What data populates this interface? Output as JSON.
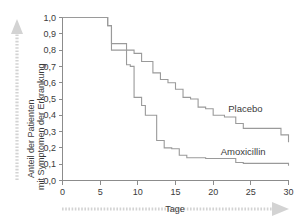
{
  "chart_data": {
    "type": "line",
    "subtype": "kaplan-meier-step",
    "title": "",
    "xlabel": "Tage",
    "ylabel": "Anteil der Patienten mit Symptomen der Erkrankung",
    "ylabel_lines": [
      "Anteil der Patienten",
      "mit Symptomen der Erkrankung"
    ],
    "xlim": [
      0,
      30
    ],
    "ylim": [
      0.0,
      1.0
    ],
    "xticks": [
      0,
      5,
      10,
      15,
      20,
      25,
      30
    ],
    "xtick_labels": [
      "0",
      "5",
      "10",
      "15",
      "20",
      "25",
      "30"
    ],
    "yticks": [
      0.0,
      0.1,
      0.2,
      0.3,
      0.4,
      0.5,
      0.6,
      0.7,
      0.8,
      0.9,
      1.0
    ],
    "ytick_labels": [
      "0,0",
      "0,1",
      "0,2",
      "0,3",
      "0,4",
      "0,5",
      "0,6",
      "0,7",
      "0,8",
      "0,9",
      "1,0"
    ],
    "grid": false,
    "legend_position": "inline-annotation",
    "decimal_separator": ",",
    "line_color": "#9a9a9a",
    "axis_color": "#8c8c8c",
    "text_color": "#3a3a3a",
    "arrow_color": "#d3d3d3",
    "series": [
      {
        "name": "Placebo",
        "label": "Placebo",
        "label_x": 22.0,
        "label_y": 0.42,
        "x": [
          0,
          5.5,
          6.0,
          6.5,
          7.5,
          8.5,
          9.5,
          10.5,
          11.5,
          12.0,
          13.0,
          14.0,
          15.0,
          16.0,
          17.0,
          18.0,
          19.0,
          20.0,
          21.5,
          23.0,
          24.0,
          27.5,
          29.0,
          30.0
        ],
        "y": [
          1.0,
          1.0,
          0.95,
          0.84,
          0.84,
          0.8,
          0.78,
          0.73,
          0.73,
          0.66,
          0.62,
          0.6,
          0.56,
          0.51,
          0.5,
          0.45,
          0.44,
          0.4,
          0.39,
          0.35,
          0.32,
          0.32,
          0.28,
          0.235
        ]
      },
      {
        "name": "Amoxicillin",
        "label": "Amoxicillin",
        "label_x": 21.0,
        "label_y": 0.155,
        "x": [
          0,
          5.5,
          6.0,
          6.5,
          7.5,
          8.5,
          9.0,
          9.5,
          10.5,
          11.0,
          11.5,
          12.5,
          13.5,
          14.5,
          15.5,
          16.5,
          19.0,
          23.0,
          24.0,
          30.0
        ],
        "y": [
          1.0,
          1.0,
          0.95,
          0.8,
          0.8,
          0.71,
          0.7,
          0.51,
          0.46,
          0.4,
          0.4,
          0.245,
          0.2,
          0.195,
          0.155,
          0.14,
          0.135,
          0.11,
          0.105,
          0.09
        ]
      }
    ]
  },
  "y_arrow": {
    "name": "vertical-up-arrow",
    "direction": "up"
  },
  "x_arrow": {
    "name": "horizontal-right-arrow",
    "direction": "right"
  }
}
